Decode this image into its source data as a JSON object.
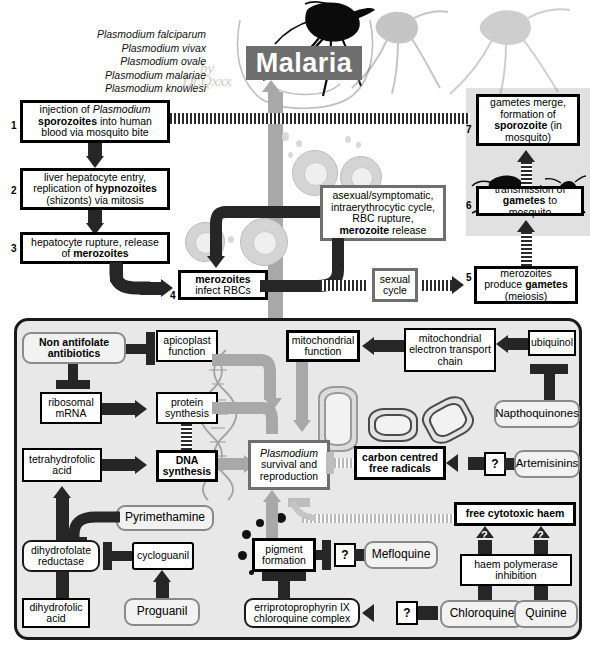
{
  "title": "Malaria",
  "species_list": [
    "Plasmodium falciparum",
    "Plasmodium vivax",
    "Plasmodium ovale",
    "Plasmodium malariae",
    "Plasmodium knowlesi"
  ],
  "lifecycle": {
    "steps": [
      {
        "n": "1",
        "lines": [
          "injection of ",
          "Plasmodium",
          " sporozoites",
          " into human blood via mosquito bite"
        ],
        "text": "injection of Plasmodium sporozoites into human blood via mosquito bite"
      },
      {
        "n": "2",
        "text": "liver hepatocyte entry, replication of hypnozoites (shizonts) via mitosis"
      },
      {
        "n": "3",
        "text": "hepatocyte rupture, release of merozoites"
      },
      {
        "n": "4",
        "text": "merozoites infect RBCs"
      },
      {
        "n": "5",
        "text": "merozoites produce gametes (meiosis)"
      },
      {
        "n": "6",
        "text": "transmission of gametes to mosquito"
      },
      {
        "n": "7",
        "text": "gametes merge, formation of sporozoite (in mosquito)"
      }
    ],
    "asexual_box": "asexual/symptomatic, intraerythrocytic cycle, RBC rupture, merozoite release",
    "sexual_cycle": "sexual cycle"
  },
  "panel": {
    "targets": {
      "apicoplast": "apicoplast function",
      "ribosomal_mrna": "ribosomal mRNA",
      "protein_synthesis": "protein synthesis",
      "dna_synthesis": "DNA synthesis",
      "tetrahydrofolic": "tetrahydrofolic acid",
      "dihydrofolate_reductase": "dihydrofolate reductase",
      "dihydrofolic": "dihydrofolic acid",
      "plasmodium_survival": "Plasmodium survival and reproduction",
      "mito_function": "mitochondrial function",
      "mito_etc": "mitochondrial electron transport chain",
      "ubiquinol": "ubiquinol",
      "carbon_radicals": "carbon centred free radicals",
      "pigment_formation": "pigment formation",
      "free_cytotoxic_haem": "free cytotoxic haem",
      "haem_polymerase": "haem polymerase inhibition",
      "erriprotoprophyrin": "erriprotoprophyrin IX chloroquine complex"
    },
    "drugs": {
      "non_antifolate": "Non antifolate antibiotics",
      "pyrimethamine": "Pyrimethamine",
      "cycloguanil": "cycloguanil",
      "proguanil": "Proguanil",
      "napthoquinones": "Napthoquinones",
      "artemisinins": "Artemisinins",
      "mefloquine": "Mefloquine",
      "chloroquine": "Chloroquine",
      "quinine": "Quinine"
    },
    "unknown_marker": "?"
  },
  "colors": {
    "title_bg": "#6e6e6e",
    "panel_bg": "#e8e8e8",
    "arrow_dark": "#262626",
    "arrow_light": "#a8a8a8",
    "mosquito_zone": "#d7d7d7"
  }
}
